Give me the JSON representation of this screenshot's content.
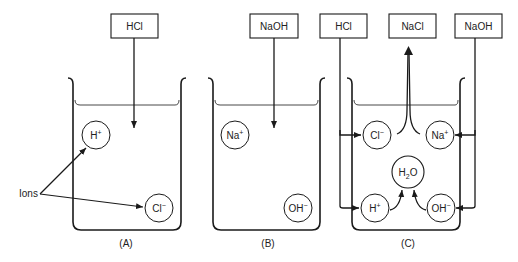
{
  "diagram": {
    "panels": [
      {
        "id": "A",
        "caption": "(A)",
        "input_box": "HCl",
        "ions": [
          {
            "symbol": "H",
            "charge": "+"
          },
          {
            "symbol": "Cl",
            "charge": "−"
          }
        ],
        "annotation": "Ions"
      },
      {
        "id": "B",
        "caption": "(B)",
        "input_box": "NaOH",
        "ions": [
          {
            "symbol": "Na",
            "charge": "+"
          },
          {
            "symbol": "OH",
            "charge": "−"
          }
        ]
      },
      {
        "id": "C",
        "caption": "(C)",
        "input_boxes": [
          "HCl",
          "NaOH"
        ],
        "output_box": "NaCl",
        "ions": [
          {
            "symbol": "Cl",
            "charge": "−"
          },
          {
            "symbol": "Na",
            "charge": "+"
          },
          {
            "symbol": "H",
            "charge": "+"
          },
          {
            "symbol": "OH",
            "charge": "−"
          }
        ],
        "product": {
          "symbol": "H",
          "sub": "2",
          "rest": "O"
        }
      }
    ]
  },
  "colors": {
    "line": "#1a1a1a",
    "background": "#ffffff"
  }
}
